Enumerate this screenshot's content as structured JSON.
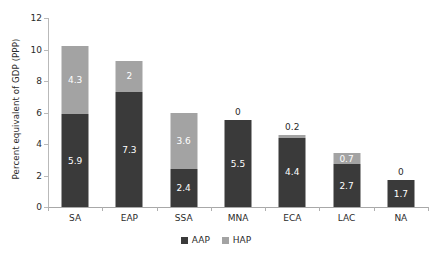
{
  "chart_data": {
    "type": "bar",
    "subtype": "stacked-vertical",
    "title": "",
    "subtitle": "",
    "xlabel": "",
    "ylabel": "Percent equivalent of GDP (PPP)",
    "categories": [
      "SA",
      "EAP",
      "SSA",
      "MNA",
      "ECA",
      "LAC",
      "NA"
    ],
    "series": [
      {
        "name": "AAP",
        "color": "#3a3a3a",
        "values": [
          5.9,
          7.3,
          2.4,
          5.5,
          4.4,
          2.7,
          1.7
        ],
        "labels": [
          "5.9",
          "7.3",
          "2.4",
          "5.5",
          "4.4",
          "2.7",
          "1.7"
        ]
      },
      {
        "name": "HAP",
        "color": "#a3a3a3",
        "values": [
          4.3,
          2,
          3.6,
          0,
          0.2,
          0.7,
          0
        ],
        "labels": [
          "4.3",
          "2",
          "3.6",
          "0",
          "0.2",
          "0.7",
          "0"
        ]
      }
    ],
    "totals": [
      10.2,
      9.3,
      6.0,
      5.5,
      4.6,
      3.4,
      1.7
    ],
    "ylim": [
      0,
      12
    ],
    "yticks": [
      0,
      2,
      4,
      6,
      8,
      10,
      12
    ],
    "ytick_labels": [
      "0",
      "2",
      "4",
      "6",
      "8",
      "10",
      "12"
    ],
    "grid": false,
    "legend": {
      "position": "bottom-center",
      "entries": [
        {
          "label": "AAP",
          "color": "#3a3a3a"
        },
        {
          "label": "HAP",
          "color": "#a3a3a3"
        }
      ]
    }
  },
  "colors": {
    "background": "#ffffff",
    "axis": "#b0b0b0",
    "text": "#2b2b2b",
    "value_text_on_bar": "#ffffff",
    "aap": "#3a3a3a",
    "hap": "#a3a3a3"
  }
}
